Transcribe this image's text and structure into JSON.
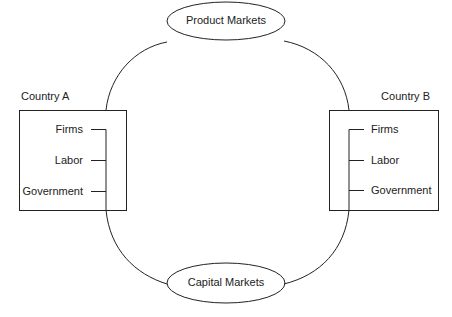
{
  "diagram": {
    "type": "flow",
    "nodes": {
      "product_markets": "Product Markets",
      "capital_markets": "Capital Markets",
      "country_a": {
        "title": "Country A",
        "items": [
          "Firms",
          "Labor",
          "Government"
        ]
      },
      "country_b": {
        "title": "Country B",
        "items": [
          "Firms",
          "Labor",
          "Government"
        ]
      }
    },
    "colors": {
      "stroke": "#222222",
      "background": "#ffffff"
    }
  }
}
